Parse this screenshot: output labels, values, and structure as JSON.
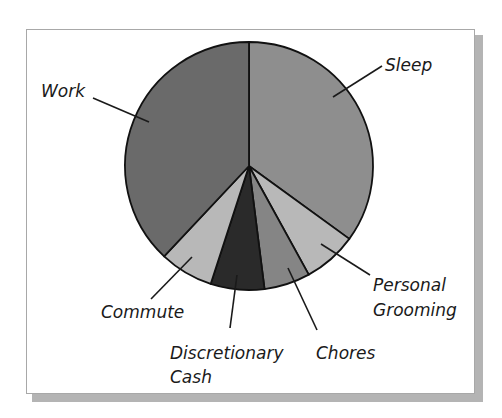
{
  "chart_data": {
    "type": "pie",
    "title": "",
    "unit": "percent of day (estimated from slice angles)",
    "start_angle": "12 o'clock, clockwise",
    "categories": [
      "Sleep",
      "Personal Grooming",
      "Chores",
      "Discretionary Cash",
      "Commute",
      "Work"
    ],
    "values": [
      35,
      7,
      6,
      7,
      7,
      38
    ],
    "colors": [
      "#8e8e8e",
      "#b8b8b8",
      "#858585",
      "#2a2a2a",
      "#b8b8b8",
      "#6a6a6a"
    ],
    "legend": "none (leader-line labels)"
  },
  "labels": {
    "sleep": "Sleep",
    "personal_1": "Personal",
    "personal_2": "Grooming",
    "chores": "Chores",
    "discretionary_1": "Discretionary",
    "discretionary_2": "Cash",
    "commute": "Commute",
    "work": "Work"
  }
}
